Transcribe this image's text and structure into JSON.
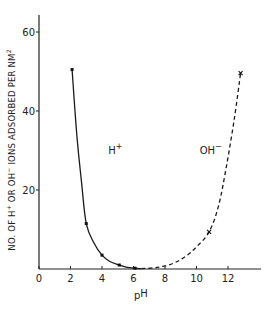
{
  "chart_data": {
    "type": "line",
    "title": "",
    "xlabel": "pH",
    "ylabel": "NO. OF H+ OR OH- IONS ADSORBED PER NM2",
    "xlim": [
      0,
      14
    ],
    "ylim": [
      0,
      64
    ],
    "x_ticks": [
      0,
      2,
      4,
      6,
      8,
      10,
      12
    ],
    "x_tick_labels": [
      "0",
      "2",
      "4",
      "6",
      "8",
      "10",
      "12"
    ],
    "y_ticks": [
      20,
      40,
      60
    ],
    "y_tick_labels": [
      "20",
      "40",
      "60"
    ],
    "grid": false,
    "legend": "none",
    "series": [
      {
        "name": "H+",
        "style": "solid",
        "marker": "dot",
        "points": [
          [
            2.1,
            50.5
          ],
          [
            3.0,
            11.5
          ],
          [
            4.0,
            3.5
          ],
          [
            5.1,
            1.0
          ],
          [
            6.1,
            0.2
          ]
        ],
        "curve": [
          [
            2.1,
            50.5
          ],
          [
            2.4,
            34
          ],
          [
            2.7,
            22
          ],
          [
            3.0,
            11.5
          ],
          [
            3.5,
            6.5
          ],
          [
            4.0,
            3.5
          ],
          [
            4.5,
            1.9
          ],
          [
            5.1,
            1.0
          ],
          [
            5.6,
            0.4
          ],
          [
            6.1,
            0.2
          ],
          [
            6.5,
            0.1
          ]
        ]
      },
      {
        "name": "OH-",
        "style": "dashed",
        "marker": "cross",
        "points": [
          [
            10.8,
            9.4
          ],
          [
            12.8,
            49.6
          ]
        ],
        "curve": [
          [
            6.5,
            0.1
          ],
          [
            7.5,
            0.4
          ],
          [
            8.5,
            1.4
          ],
          [
            9.3,
            3.2
          ],
          [
            10.0,
            5.6
          ],
          [
            10.8,
            9.4
          ],
          [
            11.4,
            16
          ],
          [
            11.9,
            26
          ],
          [
            12.4,
            38
          ],
          [
            12.8,
            49.6
          ]
        ]
      }
    ],
    "annotations": [
      {
        "text": "H+",
        "x": 4.4,
        "y": 29,
        "sup": "+"
      },
      {
        "text": "OH-",
        "x": 10.2,
        "y": 29,
        "sup": "-"
      }
    ]
  }
}
